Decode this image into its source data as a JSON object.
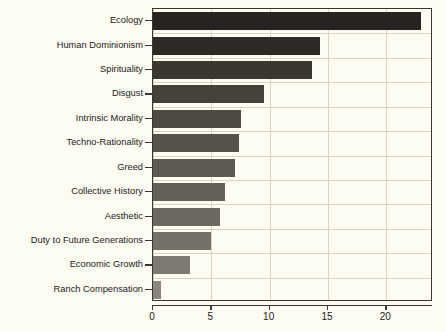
{
  "chart_data": {
    "type": "bar",
    "orientation": "horizontal",
    "title": "",
    "xlabel": "",
    "ylabel": "",
    "categories": [
      "Ecology",
      "Human Dominionism",
      "Spirituality",
      "Disgust",
      "Intrinsic Morality",
      "Techno-Rationality",
      "Greed",
      "Collective History",
      "Aesthetic",
      "Duty to Future Generations",
      "Economic Growth",
      "Ranch Compensation"
    ],
    "values": [
      23,
      14.3,
      13.6,
      9.5,
      7.5,
      7.4,
      7.0,
      6.2,
      5.7,
      5.0,
      3.2,
      0.7
    ],
    "bar_colors": [
      "#262320",
      "#2e2b26",
      "#3a372f",
      "#454239",
      "#4e4b42",
      "#56534a",
      "#5d5a51",
      "#646159",
      "#6c6960",
      "#747168",
      "#7d7a71",
      "#8a8780"
    ],
    "xlim": [
      0,
      24
    ],
    "ylim": [
      0,
      12
    ],
    "xticks": [
      0,
      5,
      10,
      15,
      20
    ],
    "xticklabels": [
      "0",
      "5",
      "10",
      "15",
      "20"
    ],
    "grid": {
      "vertical": true,
      "horizontal": true,
      "color": "#d8d4c2"
    },
    "background_color": "#fdfcf2",
    "frame_color": "#3a372f",
    "legend": null
  }
}
